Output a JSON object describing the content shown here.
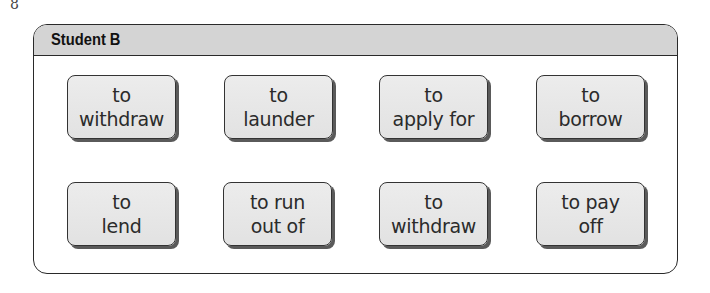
{
  "page_mark": "8",
  "panel": {
    "title": "Student B",
    "header_color": "#d4d4d4",
    "cards": [
      {
        "line1": "to",
        "line2": "withdraw"
      },
      {
        "line1": "to",
        "line2": "launder"
      },
      {
        "line1": "to",
        "line2": "apply for"
      },
      {
        "line1": "to",
        "line2": "borrow"
      },
      {
        "line1": "to",
        "line2": "lend"
      },
      {
        "line1": "to run",
        "line2": "out of"
      },
      {
        "line1": "to",
        "line2": "withdraw"
      },
      {
        "line1": "to pay",
        "line2": "off"
      }
    ]
  }
}
